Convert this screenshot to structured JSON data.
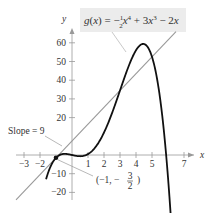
{
  "chart_data": {
    "type": "line",
    "xlabel": "x",
    "ylabel": "y",
    "xlim": [
      -3.5,
      7.8
    ],
    "ylim": [
      -28,
      68
    ],
    "x_ticks": [
      -3,
      -2,
      1,
      2,
      3,
      4,
      5,
      7
    ],
    "x_tick_labels": [
      "−3",
      "−2",
      "1",
      "2",
      "3",
      "4",
      "5",
      "7"
    ],
    "y_ticks": [
      -20,
      -10,
      20,
      30,
      40,
      50,
      60
    ],
    "y_tick_labels": [
      "−20",
      "−10",
      "20",
      "30",
      "40",
      "50",
      "60"
    ],
    "grid": false,
    "series": [
      {
        "name": "g(x) = -1/2 x^4 + 3x^3 - 2x",
        "kind": "curve",
        "color": "#111111",
        "x": [
          -1.6,
          -1,
          0,
          1,
          2,
          3,
          4,
          4.5,
          5,
          5.8,
          6.2
        ],
        "y": [
          -20.2,
          -1.5,
          0,
          0.5,
          12,
          34.5,
          56,
          59.3,
          52.5,
          7.8,
          -22.3
        ]
      },
      {
        "name": "Tangent line, slope 9",
        "kind": "line",
        "color": "#999999",
        "x": [
          -3.5,
          6.5
        ],
        "y": [
          -24,
          66
        ]
      }
    ],
    "annotations": [
      {
        "text": "Slope = 9",
        "target": "tangent line"
      },
      {
        "text": "(−1, −3/2)",
        "point": [
          -1,
          -1.5
        ]
      }
    ]
  },
  "labels": {
    "function_label": "g(x) = −½x⁴ + 3x³ − 2x",
    "slope_label": "Slope = 9",
    "point_label": "(−1, −",
    "point_frac_num": "3",
    "point_frac_den": "2",
    "x_axis": "x",
    "y_axis": "y"
  }
}
